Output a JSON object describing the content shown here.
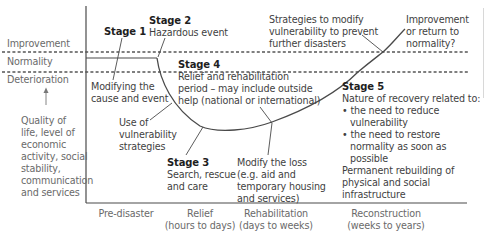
{
  "y_axis": {
    "levels": {
      "improvement": "Improvement",
      "normality": "Normality",
      "deterioration": "Deterioration"
    },
    "label": [
      "Quality of",
      "life, level of",
      "economic",
      "activity, social",
      "stability,",
      "communication",
      "and services"
    ]
  },
  "x_axis": {
    "phases": [
      {
        "name": "Pre-disaster",
        "duration": ""
      },
      {
        "name": "Relief",
        "duration": "(hours to days)"
      },
      {
        "name": "Rehabilitation",
        "duration": "(days to weeks)"
      },
      {
        "name": "Reconstruction",
        "duration": "(weeks to years)"
      }
    ]
  },
  "stages": {
    "stage1": {
      "title": "Stage 1"
    },
    "stage2": {
      "title": "Stage 2",
      "desc": "Hazardous event"
    },
    "stage3": {
      "title": "Stage 3",
      "desc": [
        "Search, rescue",
        "and care"
      ]
    },
    "stage4": {
      "title": "Stage 4",
      "desc": [
        "Relief and rehabilitation",
        "period – may include outside",
        "help (national or international)"
      ]
    },
    "stage5": {
      "title": "Stage 5",
      "desc": [
        "Nature of recovery related to:"
      ],
      "bullets": [
        [
          "the need to reduce",
          "vulnerability"
        ],
        [
          "the need to restore",
          "normality as soon as",
          "possible"
        ]
      ],
      "footer": [
        "Permanent rebuilding of",
        "physical and social",
        "infrastructure"
      ]
    }
  },
  "annotations": {
    "modifying_cause": [
      "Modifying the",
      "cause and event"
    ],
    "use_of_vulnerability": [
      "Use of",
      "vulnerability",
      "strategies"
    ],
    "modify_loss": [
      "Modify the loss",
      "(e.g. aid and",
      "temporary housing",
      "and services)"
    ],
    "strategies_modify": [
      "Strategies to modify",
      "vulnerability to prevent",
      "further disasters"
    ],
    "improvement_return": [
      "Improvement",
      "or return to",
      "normality?"
    ]
  },
  "colors": {
    "line": "#4a4a4a",
    "dashed": "#555555",
    "text": "#3f3f3f",
    "bold": "#1e1e1e"
  }
}
